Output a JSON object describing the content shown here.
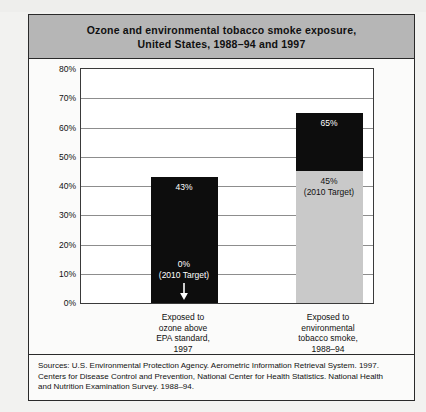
{
  "figure": {
    "title_lines": [
      "Ozone and environmental tobacco smoke exposure,",
      "United States, 1988–94 and 1997"
    ],
    "sources_lines": [
      "Sources:  U.S. Environmental Protection Agency. Aerometric Information Retrieval System. 1997.",
      "Centers for Disease Control and Prevention, National Center for Health Statistics. National Health",
      "and Nutrition Examination Survey. 1988–94."
    ]
  },
  "colors": {
    "banner_bg": "#b6b6b6",
    "bar_dark": "#0d0d0d",
    "bar_light": "#c9c9c9",
    "frame": "#2a2a2a",
    "gridline": "#8d8d8d"
  },
  "chart_data": {
    "type": "bar",
    "title": "Ozone and environmental tobacco smoke exposure, United States, 1988–94 and 1997",
    "xlabel": "",
    "ylabel": "",
    "ylim": [
      0,
      80
    ],
    "ytick_labels": [
      "80%",
      "70%",
      "60%",
      "50%",
      "40%",
      "30%",
      "20%",
      "10%",
      "0%"
    ],
    "ytick_values": [
      80,
      70,
      60,
      50,
      40,
      30,
      20,
      10,
      0
    ],
    "grid": true,
    "legend": "none",
    "categories": [
      "Exposed to ozone above EPA standard, 1997",
      "Exposed to environmental tobacco smoke, 1988–94"
    ],
    "category_label_lines": [
      [
        "Exposed to",
        "ozone above",
        "EPA standard,",
        "1997"
      ],
      [
        "Exposed to",
        "environmental",
        "tobacco smoke,",
        "1988–94"
      ]
    ],
    "values": [
      43,
      65
    ],
    "bars": [
      {
        "category": "Exposed to ozone above EPA standard, 1997",
        "total": 43,
        "total_label": "43%",
        "target": 0,
        "target_label_lines": [
          "0%",
          "(2010 Target)"
        ],
        "segments": [
          {
            "name": "current-above-target",
            "from": 0,
            "to": 43,
            "fill": "dark"
          }
        ]
      },
      {
        "category": "Exposed to environmental tobacco smoke, 1988–94",
        "total": 65,
        "total_label": "65%",
        "target": 45,
        "target_label_lines": [
          "45%",
          "(2010 Target)"
        ],
        "segments": [
          {
            "name": "target-portion",
            "from": 0,
            "to": 45,
            "fill": "light"
          },
          {
            "name": "above-target-portion",
            "from": 45,
            "to": 65,
            "fill": "dark"
          }
        ]
      }
    ]
  }
}
